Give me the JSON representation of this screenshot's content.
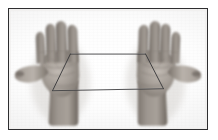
{
  "image": {
    "kind": "photographic-illustration",
    "subject": "two open hands holding a string loop",
    "palette": {
      "frame_border": "#2e2e30",
      "page_background": "#ffffff",
      "plate_background": "#fbfbfb",
      "skin_midtone": "#9a938d",
      "skin_shadow": "#5d5650",
      "skin_highlight": "#c9c3bd",
      "string_color": "#3a3a3c",
      "shadow_soft": "#d6d3cf"
    },
    "frame": {
      "x": 8,
      "y": 8,
      "width": 200,
      "height": 122,
      "border_width": 1.6
    },
    "hands": [
      {
        "id": "left-hand",
        "side": "left",
        "orientation": "palm-toward-viewer",
        "fingers": 4,
        "thumb": "extended-left",
        "wrist": "enters-from-bottom"
      },
      {
        "id": "right-hand",
        "side": "right",
        "orientation": "palm-toward-viewer",
        "fingers": 4,
        "thumb": "extended-right",
        "wrist": "enters-from-bottom"
      }
    ],
    "string": {
      "description": "single loop of string stretched between both hands forming a quadrilateral",
      "segments": [
        {
          "id": "upper-strand",
          "from": [
            76,
            52
          ],
          "to": [
            144,
            52
          ]
        },
        {
          "id": "lower-strand",
          "from": [
            58,
            89
          ],
          "to": [
            163,
            85
          ]
        },
        {
          "id": "left-riser",
          "from": [
            76,
            52
          ],
          "to": [
            58,
            89
          ]
        },
        {
          "id": "right-riser",
          "from": [
            144,
            52
          ],
          "to": [
            163,
            85
          ]
        }
      ],
      "shape": "trapezoid"
    },
    "labels": {
      "figure_title": "",
      "caption": ""
    }
  }
}
